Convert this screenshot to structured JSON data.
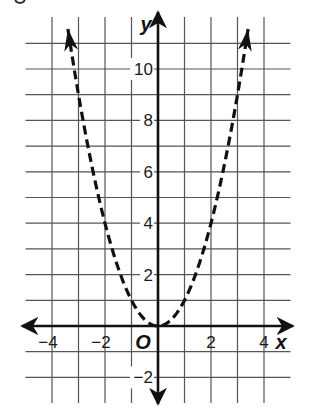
{
  "chart_data": {
    "type": "line",
    "title": "",
    "function": "y = x^2",
    "xlabel": "x",
    "ylabel": "y",
    "origin_label": "O",
    "xlim": [
      -5,
      5
    ],
    "ylim": [
      -3,
      12
    ],
    "grid": true,
    "grid_step": 1,
    "x_ticks": [
      -4,
      -2,
      2,
      4
    ],
    "x_tick_labels": [
      "−4",
      "−2",
      "2",
      "4"
    ],
    "y_ticks": [
      -2,
      2,
      4,
      6,
      8,
      10
    ],
    "y_tick_labels": [
      "−2",
      "2",
      "4",
      "6",
      "8",
      "10"
    ],
    "line_style": "dashed",
    "line_color": "#111111",
    "arrows_at_ends": true,
    "series": [
      {
        "name": "y = x^2",
        "x": [
          -3.4,
          -3,
          -2,
          -1,
          0,
          1,
          2,
          3,
          3.4
        ],
        "y": [
          11.56,
          9,
          4,
          1,
          0,
          1,
          4,
          9,
          11.56
        ]
      }
    ],
    "legend": null
  },
  "layout": {
    "px_per_unit_x": 26.5,
    "px_per_unit_y": 25.7,
    "origin_px": [
      158,
      326
    ],
    "grid_color": "#555555",
    "axis_color": "#111111"
  }
}
